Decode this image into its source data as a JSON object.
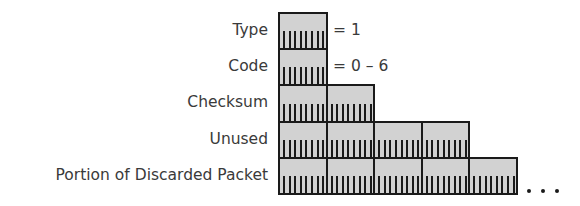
{
  "diagram": {
    "fields": [
      {
        "label": "Type",
        "bytes": 1,
        "note": "= 1"
      },
      {
        "label": "Code",
        "bytes": 1,
        "note": "= 0 – 6"
      },
      {
        "label": "Checksum",
        "bytes": 2,
        "note": ""
      },
      {
        "label": "Unused",
        "bytes": 4,
        "note": ""
      },
      {
        "label": "Portion of Discarded Packet",
        "bytes": 5,
        "note": "",
        "continues": true
      }
    ],
    "bits_per_byte": 8,
    "continuation": "...",
    "colors": {
      "byte_fill": "#d2d2d2",
      "border": "#1a1a1a",
      "text": "#3a3a3a"
    }
  }
}
